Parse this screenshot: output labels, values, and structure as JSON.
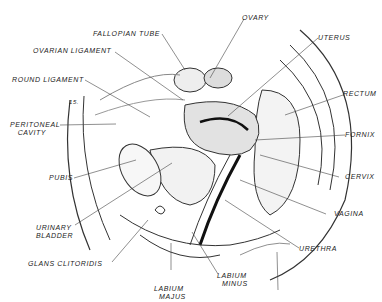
{
  "diagram": {
    "marker": "15.",
    "labels": [
      {
        "id": "fallopian-tube",
        "text": "FALLOPIAN TUBE"
      },
      {
        "id": "ovary",
        "text": "OVARY"
      },
      {
        "id": "ovarian-ligament",
        "text": "OVARIAN LIGAMENT"
      },
      {
        "id": "uterus",
        "text": "UTERUS"
      },
      {
        "id": "round-ligament",
        "text": "ROUND LIGAMENT"
      },
      {
        "id": "rectum",
        "text": "RECTUM"
      },
      {
        "id": "peritoneal-cavity",
        "text": "PERITONEAL\n   CAVITY"
      },
      {
        "id": "fornix",
        "text": "FORNIX"
      },
      {
        "id": "pubis",
        "text": "PUBIS"
      },
      {
        "id": "cervix",
        "text": "CERVIX"
      },
      {
        "id": "vagina",
        "text": "VAGINA"
      },
      {
        "id": "urinary-bladder",
        "text": "URINARY\nBLADDER"
      },
      {
        "id": "urethra",
        "text": "URETHRA"
      },
      {
        "id": "glans-clitoridis",
        "text": "GLANS CLITORIDIS"
      },
      {
        "id": "labium-majus",
        "text": "LABIUM\n  MAJUS"
      },
      {
        "id": "labium-minus",
        "text": "LABIUM\n  MINUS"
      }
    ]
  }
}
